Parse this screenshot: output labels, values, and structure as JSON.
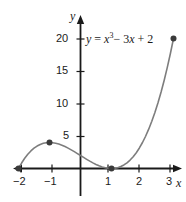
{
  "chart_data": {
    "type": "line",
    "title": "",
    "subtitle": "",
    "equation_label": "y = x³− 3x + 2",
    "equation_parts": {
      "lhs": "y",
      "equals": "=",
      "var": "x",
      "exponent": "3",
      "term2": "− 3",
      "var2": "x",
      "term3": "+ 2"
    },
    "xlabel": "x",
    "ylabel": "y",
    "xlim": [
      -2.15,
      3.25
    ],
    "ylim": [
      -3.5,
      23
    ],
    "grid": false,
    "legend": null,
    "x_ticks": [
      -2,
      -1,
      1,
      2,
      3
    ],
    "x_tick_labels": [
      "−2",
      "−1",
      "1",
      "2",
      "3"
    ],
    "y_ticks": [
      5,
      10,
      15,
      20
    ],
    "y_tick_labels": [
      "5",
      "10",
      "15",
      "20"
    ],
    "x": [
      -2.0,
      -1.9,
      -1.8,
      -1.7,
      -1.6,
      -1.5,
      -1.4,
      -1.3,
      -1.2,
      -1.1,
      -1.0,
      -0.9,
      -0.8,
      -0.7,
      -0.6,
      -0.5,
      -0.4,
      -0.3,
      -0.2,
      -0.1,
      0.0,
      0.1,
      0.2,
      0.3,
      0.4,
      0.5,
      0.6,
      0.7,
      0.8,
      0.9,
      1.0,
      1.1,
      1.2,
      1.3,
      1.4,
      1.5,
      1.6,
      1.7,
      1.8,
      1.9,
      2.0,
      2.1,
      2.2,
      2.3,
      2.4,
      2.5,
      2.6,
      2.7,
      2.8,
      2.9,
      3.0
    ],
    "y": [
      0.0,
      0.841,
      1.568,
      2.187,
      2.704,
      3.125,
      3.456,
      3.703,
      3.872,
      3.969,
      4.0,
      3.971,
      3.888,
      3.757,
      3.584,
      3.375,
      3.136,
      2.873,
      2.592,
      2.299,
      2.0,
      1.701,
      1.408,
      1.127,
      0.864,
      0.625,
      0.416,
      0.243,
      0.112,
      0.029,
      0.0,
      0.031,
      0.128,
      0.297,
      0.544,
      0.875,
      1.296,
      1.813,
      2.432,
      3.159,
      4.0,
      4.961,
      6.048,
      7.267,
      8.624,
      10.125,
      11.776,
      13.583,
      15.552,
      17.689,
      20.0
    ],
    "marked_points": [
      {
        "x": -2,
        "y": 0,
        "label": "x-intercept"
      },
      {
        "x": -1,
        "y": 4,
        "label": "local-maximum"
      },
      {
        "x": 1,
        "y": 0,
        "label": "x-intercept-repeated"
      },
      {
        "x": 3,
        "y": 20,
        "label": "endpoint"
      }
    ],
    "curve_color": "#7d7d7d",
    "axis_color": "#1a1a1a",
    "point_color": "#3a3a3a",
    "background_color": "#ffffff"
  }
}
